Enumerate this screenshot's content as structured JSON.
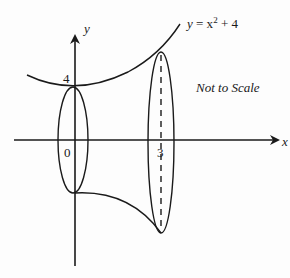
{
  "diagram": {
    "type": "solid-of-revolution",
    "curve_label": {
      "y": "y",
      "eq": " = x",
      "exp": "2",
      "rest": " + 4"
    },
    "note": "Not to Scale",
    "axes": {
      "x_label": "x",
      "y_label": "y"
    },
    "ticks": {
      "y_intercept": "4",
      "origin": "0",
      "x_end": "3"
    },
    "colors": {
      "stroke": "#1a1a1a",
      "background": "#fdfdfd"
    }
  }
}
